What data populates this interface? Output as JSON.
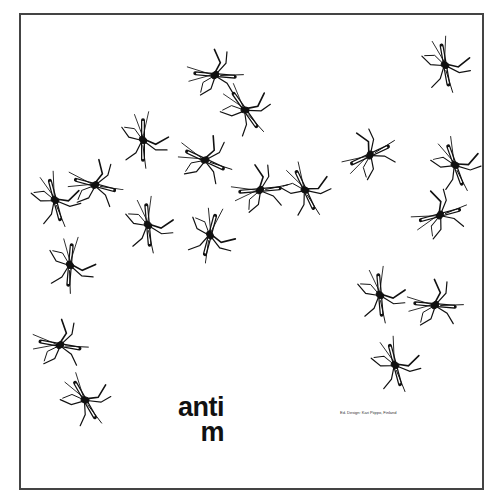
{
  "poster": {
    "title_line1": "anti",
    "title_line2": "m",
    "credit": "Ed. Design: Kari Piippo, Finland",
    "border_color": "#444444",
    "ink_color": "#111111"
  },
  "mosquitoes": [
    {
      "x": 215,
      "y": 75,
      "rot": -40
    },
    {
      "x": 245,
      "y": 110,
      "rot": 10
    },
    {
      "x": 143,
      "y": 140,
      "rot": 45
    },
    {
      "x": 205,
      "y": 160,
      "rot": -20
    },
    {
      "x": 55,
      "y": 200,
      "rot": 30
    },
    {
      "x": 95,
      "y": 185,
      "rot": -30
    },
    {
      "x": 148,
      "y": 225,
      "rot": 40
    },
    {
      "x": 210,
      "y": 235,
      "rot": 60
    },
    {
      "x": 260,
      "y": 190,
      "rot": -50
    },
    {
      "x": 305,
      "y": 190,
      "rot": 20
    },
    {
      "x": 370,
      "y": 155,
      "rot": -70
    },
    {
      "x": 445,
      "y": 65,
      "rot": 35
    },
    {
      "x": 455,
      "y": 165,
      "rot": 25
    },
    {
      "x": 440,
      "y": 215,
      "rot": -60
    },
    {
      "x": 70,
      "y": 265,
      "rot": 50
    },
    {
      "x": 380,
      "y": 295,
      "rot": 40
    },
    {
      "x": 435,
      "y": 305,
      "rot": -40
    },
    {
      "x": 395,
      "y": 365,
      "rot": 30
    },
    {
      "x": 60,
      "y": 345,
      "rot": -35
    },
    {
      "x": 85,
      "y": 400,
      "rot": 15
    }
  ]
}
